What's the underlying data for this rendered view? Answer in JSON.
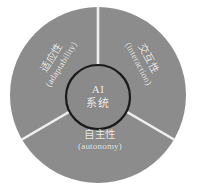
{
  "diagram": {
    "type": "segmented-circle",
    "title_visible": false,
    "background_color": "#ffffff",
    "wheel": {
      "fill_color": "#8c8c8c",
      "divider_color": "#f0f0f0",
      "center_x": 98,
      "center_y": 95,
      "radius": 88
    },
    "center": {
      "label_cn": "AI",
      "label_cn2": "系统",
      "fill_color": "#8a8a8a",
      "border_color": "#1a1a1a",
      "radius": 32,
      "center_x": 98,
      "center_y": 97
    },
    "segments": [
      {
        "id": "adaptability",
        "label_cn": "适应性",
        "label_en": "(adaptability)",
        "position": "upper-left",
        "rotation_deg": -58,
        "text_color": "#f2f2f2"
      },
      {
        "id": "interaction",
        "label_cn": "交互性",
        "label_en": "(interaction)",
        "position": "upper-right",
        "rotation_deg": 62,
        "text_color": "#f2f2f2"
      },
      {
        "id": "autonomy",
        "label_cn": "自主性",
        "label_en": "(autonomy)",
        "position": "bottom",
        "rotation_deg": 0,
        "text_color": "#f2f2f2"
      }
    ]
  }
}
